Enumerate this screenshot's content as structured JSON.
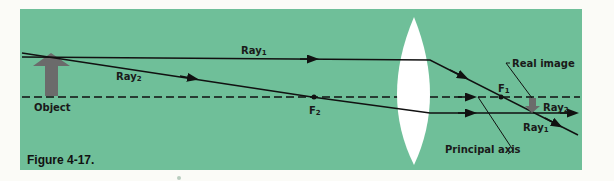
{
  "figure": {
    "caption": "Figure 4-17.",
    "background_color": "#6fbf99",
    "labels": {
      "ray1_top": "Ray",
      "ray1_top_sub": "1",
      "ray2_left": "Ray",
      "ray2_left_sub": "2",
      "object": "Object",
      "f2": "F",
      "f2_sub": "2",
      "f1": "F",
      "f1_sub": "1",
      "real_image": "Real image",
      "ray2_right": "Ray",
      "ray2_right_sub": "2",
      "ray1_right": "Ray",
      "ray1_right_sub": "1",
      "principal_axis": "Principal axis"
    }
  }
}
